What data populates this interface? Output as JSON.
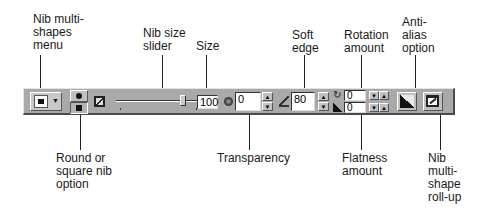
{
  "callouts_top": [
    {
      "id": "nib-multi-shapes-menu",
      "text": "Nib multi-\nshapes\nmenu"
    },
    {
      "id": "nib-size-slider",
      "text": "Nib size\nslider"
    },
    {
      "id": "size",
      "text": "Size"
    },
    {
      "id": "soft-edge",
      "text": "Soft\nedge"
    },
    {
      "id": "rotation-amount",
      "text": "Rotation\namount"
    },
    {
      "id": "anti-alias-option",
      "text": "Anti-\nalias\noption"
    }
  ],
  "callouts_bottom": [
    {
      "id": "round-or-square-nib-option",
      "text": "Round or\nsquare nib\noption"
    },
    {
      "id": "transparency",
      "text": "Transparency"
    },
    {
      "id": "flatness-amount",
      "text": "Flatness\namount"
    },
    {
      "id": "nib-multi-shape-roll-up",
      "text": "Nib\nmulti-\nshape\nroll-up"
    }
  ],
  "toolbar": {
    "size_value": "100",
    "transparency_value": "0",
    "soft_edge_value": "80",
    "rotation_value": "0",
    "flatness_value": "0",
    "slider_fraction": 0.82
  },
  "icons": {
    "spin_up": "▲",
    "spin_down": "▼",
    "dropdown": "▼"
  }
}
